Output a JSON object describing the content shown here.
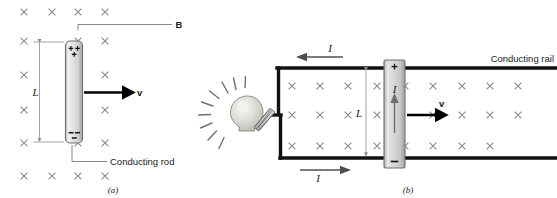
{
  "figure": {
    "panels": [
      {
        "id": "a",
        "caption": "(a)",
        "labels": {
          "field": "B",
          "length": "L",
          "velocity": "v",
          "rod": "Conducting rod",
          "charge_top": "+ +",
          "charge_top2": "+",
          "charge_bottom": "- -"
        }
      },
      {
        "id": "b",
        "caption": "(b)",
        "labels": {
          "rail": "Conducting rail",
          "current_top": "I",
          "current_bottom": "I",
          "current_rod": "I",
          "length": "L",
          "velocity": "v",
          "charge_top": "+",
          "charge_bottom": "-"
        }
      }
    ],
    "field_symbol": "x",
    "colors": {
      "field_mark": "#8a8a8a",
      "rod_fill": "#d8d8d8",
      "rod_stroke": "#6e6e6e",
      "rail": "#111111",
      "bulb_glass": "#d9dcd4",
      "ray": "#707070",
      "text": "#1a1a1a",
      "leader": "#6b6b6b"
    },
    "field_grid_a": {
      "columns_x": [
        24,
        52,
        78,
        105
      ],
      "rows_y": [
        12,
        41,
        75,
        110,
        143,
        176
      ]
    },
    "field_grid_b": {
      "columns_x": [
        292,
        320,
        348,
        377,
        405,
        433,
        462,
        490,
        518
      ],
      "rows_y": [
        86,
        115,
        146
      ]
    }
  }
}
